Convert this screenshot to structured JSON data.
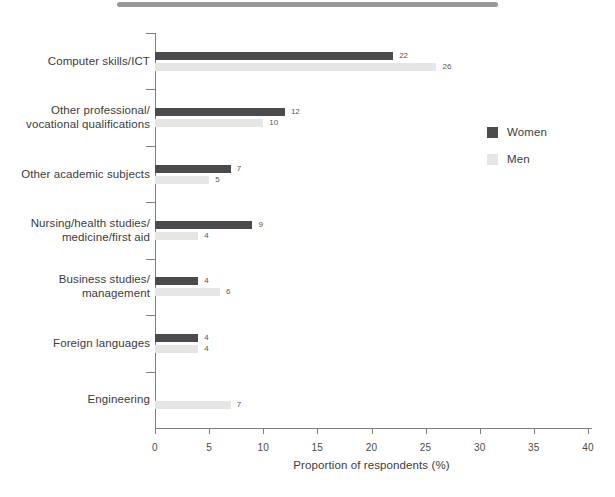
{
  "chart_data": {
    "type": "bar",
    "orientation": "horizontal",
    "title": "",
    "categories": [
      "Computer skills/ICT",
      "Other professional/\nvocational qualifications",
      "Other academic subjects",
      "Nursing/health studies/\nmedicine/first aid",
      "Business studies/\nmanagement",
      "Foreign languages",
      "Engineering"
    ],
    "series": [
      {
        "name": "Women",
        "color": "#4b4b4d",
        "values": [
          22,
          12,
          7,
          9,
          4,
          4,
          null
        ]
      },
      {
        "name": "Men",
        "color": "#e6e6e4",
        "values": [
          26,
          10,
          5,
          4,
          6,
          4,
          7
        ]
      }
    ],
    "xlabel": "Proportion of respondents (%)",
    "xlim": [
      0,
      40
    ],
    "xticks": [
      0,
      5,
      10,
      15,
      20,
      25,
      30,
      35,
      40
    ],
    "grid": false,
    "legend_position": "upper right",
    "value_labels": true
  }
}
